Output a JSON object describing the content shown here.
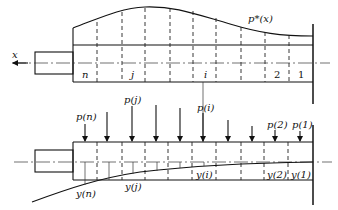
{
  "top_diagram": {
    "axis_label": "x",
    "curve_label": "p*(x)",
    "segment_labels": {
      "n": "n",
      "j": "j",
      "i": "i",
      "two": "2",
      "one": "1"
    }
  },
  "bottom_diagram": {
    "load_labels": {
      "pn": "p(n)",
      "pj": "p(j)",
      "pi": "p(i)",
      "p2": "p(2)",
      "p1": "p(1)"
    },
    "deflection_labels": {
      "yn": "y(n)",
      "yj": "y(j)",
      "yi": "y(i)",
      "y2": "y(2)",
      "y1": "y(1)"
    }
  }
}
